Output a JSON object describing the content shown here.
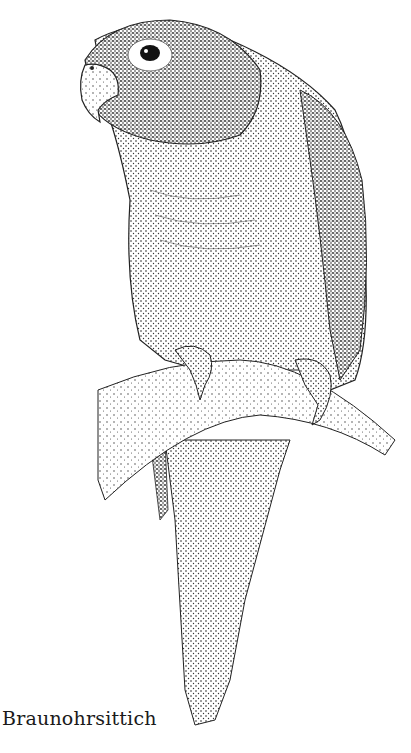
{
  "illustration": {
    "subject": "parrot perched on a branch",
    "style": "stipple pen-and-ink drawing",
    "ink_color": "#1a1a1a",
    "paper_color": "#ffffff"
  },
  "caption": {
    "text": "Braunohrsittich"
  }
}
